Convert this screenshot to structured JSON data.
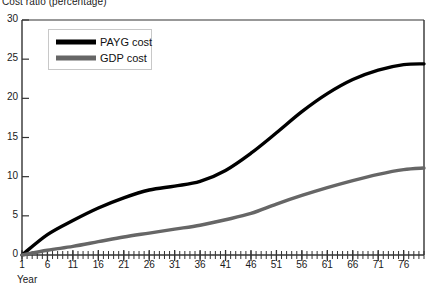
{
  "chart_data": {
    "type": "line",
    "title": "Cost ratio (percentage)",
    "xlabel": "Year",
    "ylabel": "",
    "xlim": [
      1,
      80
    ],
    "ylim": [
      0,
      30
    ],
    "grid": false,
    "legend_position": "top-left-inside",
    "x_ticks": [
      1,
      6,
      11,
      16,
      21,
      26,
      31,
      36,
      41,
      46,
      51,
      56,
      61,
      66,
      71,
      76
    ],
    "x_tick_labels": [
      "1",
      "6",
      "11",
      "16",
      "21",
      "26",
      "31",
      "36",
      "41",
      "46",
      "51",
      "56",
      "61",
      "66",
      "71",
      "76"
    ],
    "x_minor_tick_interval": 1,
    "y_ticks": [
      0,
      5,
      10,
      15,
      20,
      25,
      30
    ],
    "y_tick_labels": [
      "0",
      "5",
      "10",
      "15",
      "20",
      "25",
      "30"
    ],
    "series": [
      {
        "name": "PAYG cost",
        "color": "#000000",
        "width": 3.4,
        "x": [
          1,
          6,
          11,
          16,
          21,
          26,
          31,
          36,
          41,
          46,
          51,
          56,
          61,
          66,
          71,
          76,
          80
        ],
        "values": [
          0.0,
          2.6,
          4.4,
          6.0,
          7.3,
          8.3,
          8.8,
          9.4,
          10.8,
          13.0,
          15.6,
          18.3,
          20.6,
          22.4,
          23.6,
          24.3,
          24.4
        ]
      },
      {
        "name": "GDP cost",
        "color": "#666666",
        "width": 3.4,
        "x": [
          1,
          6,
          11,
          16,
          21,
          26,
          31,
          36,
          41,
          46,
          51,
          56,
          61,
          66,
          71,
          76,
          80
        ],
        "values": [
          0.0,
          0.6,
          1.1,
          1.7,
          2.3,
          2.8,
          3.3,
          3.8,
          4.5,
          5.3,
          6.5,
          7.6,
          8.6,
          9.5,
          10.3,
          10.9,
          11.1
        ]
      }
    ]
  },
  "legend": {
    "entries": [
      {
        "label": "PAYG cost",
        "color": "#000000"
      },
      {
        "label": "GDP cost",
        "color": "#666666"
      }
    ]
  },
  "axes": {
    "axis_color": "#333333",
    "background": "#ffffff"
  }
}
